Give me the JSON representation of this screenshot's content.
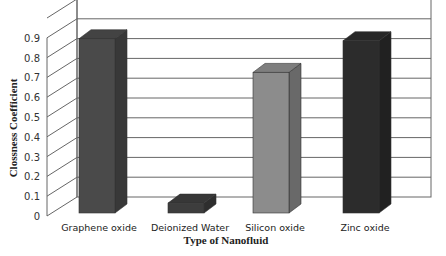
{
  "chart_data": {
    "type": "bar",
    "style": "3d-column",
    "title": "",
    "xlabel": "Type of Nanofluid",
    "ylabel": "Clossness Coefficient",
    "categories": [
      "Graphene oxide",
      "Deionized Water",
      "Silicon oxide",
      "Zinc oxide"
    ],
    "values": [
      0.88,
      0.05,
      0.71,
      0.87
    ],
    "colors": [
      "#4a4a4a",
      "#3d3d3d",
      "#8c8c8c",
      "#2c2c2c"
    ],
    "yticks": [
      "0",
      "0.1",
      "0.2",
      "0.3",
      "0.4",
      "0.5",
      "0.6",
      "0.7",
      "0.8",
      "0.9"
    ],
    "ylim": [
      0,
      1.0
    ],
    "grid": true,
    "legend": "none"
  }
}
